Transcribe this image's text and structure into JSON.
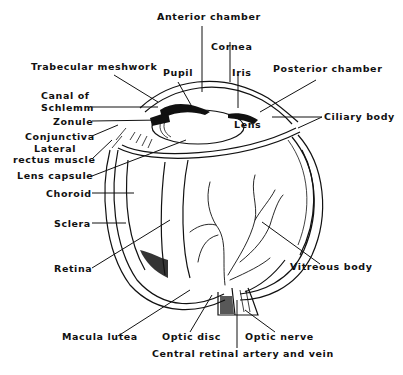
{
  "diagram": {
    "labels": {
      "anterior_chamber": "Anterior chamber",
      "cornea": "Cornea",
      "trabecular_meshwork": "Trabecular meshwork",
      "pupil": "Pupil",
      "iris": "Iris",
      "posterior_chamber": "Posterior chamber",
      "canal_of_schlemm_1": "Canal of",
      "canal_of_schlemm_2": "Schlemm",
      "zonule": "Zonule",
      "conjunctiva": "Conjunctiva",
      "lateral_rectus_1": "Lateral",
      "lateral_rectus_2": "rectus muscle",
      "lens": "Lens",
      "ciliary_body": "Ciliary body",
      "lens_capsule": "Lens capsule",
      "choroid": "Choroid",
      "sclera": "Sclera",
      "retina": "Retina",
      "vitreous_body": "Vitreous body",
      "macula_lutea": "Macula lutea",
      "optic_disc": "Optic disc",
      "optic_nerve": "Optic nerve",
      "central_retinal": "Central retinal artery and vein"
    },
    "colors": {
      "ink": "#111111",
      "background": "#ffffff"
    }
  }
}
